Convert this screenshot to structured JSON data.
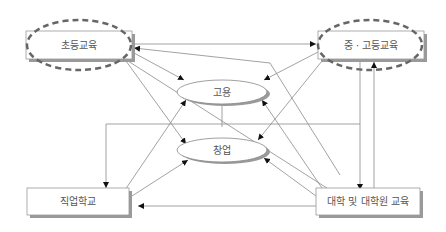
{
  "diagram": {
    "nodes": {
      "elementary": {
        "label": "초등교육"
      },
      "secondary": {
        "label": "중 · 고등교육"
      },
      "employment": {
        "label": "고용"
      },
      "startup": {
        "label": "창업"
      },
      "vocational": {
        "label": "직업학교"
      },
      "university": {
        "label": "대학 및 대학원 교육"
      }
    },
    "colors": {
      "line": "#8a8a8a",
      "box_border": "#999999",
      "shadow": "#9a9a9a",
      "dashed_highlight": "#666666",
      "text": "#555555"
    }
  }
}
